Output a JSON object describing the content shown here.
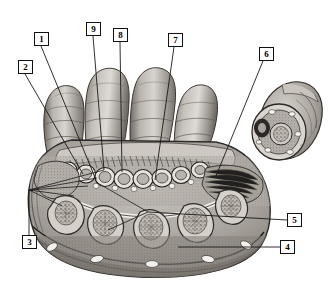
{
  "figure": {
    "kind": "anatomical-illustration",
    "style": "grayscale halftone engraving",
    "background_color": "#ffffff",
    "ink_color": "#111111",
    "leader_color": "#1a1a1a",
    "label_box": {
      "border_color": "#111111",
      "fill_color": "#ffffff",
      "text_color": "#000000",
      "width": 15,
      "height": 14
    },
    "palette": {
      "skin_light": "#d9d5d0",
      "skin_mid": "#b3aea8",
      "skin_dark": "#8a857f",
      "muscle_mid": "#9a948d",
      "muscle_dark": "#6f6a64",
      "bone_fill": "#cfcac4",
      "marrow": "#8e8881",
      "outline": "#2b2b2b",
      "fascia": "#efece8",
      "vessel": "#f5f3f0"
    }
  },
  "labels": [
    {
      "id": "1",
      "text": "1",
      "box": {
        "x": 34,
        "y": 32
      },
      "line": [
        [
          41,
          46
        ],
        [
          96,
          180
        ]
      ]
    },
    {
      "id": "2",
      "text": "2",
      "box": {
        "x": 18,
        "y": 60
      },
      "line": [
        [
          25,
          74
        ],
        [
          83,
          174
        ]
      ]
    },
    {
      "id": "3",
      "text": "3",
      "box": {
        "x": 22,
        "y": 235
      },
      "line": [
        [
          29,
          235
        ],
        [
          29,
          190
        ]
      ]
    },
    {
      "id": "4",
      "text": "4",
      "box": {
        "x": 280,
        "y": 240
      },
      "line": [
        [
          280,
          247
        ],
        [
          178,
          247
        ]
      ]
    },
    {
      "id": "5",
      "text": "5",
      "box": {
        "x": 287,
        "y": 213
      },
      "line": [
        [
          287,
          220
        ],
        [
          148,
          212
        ]
      ]
    },
    {
      "id": "6",
      "text": "6",
      "box": {
        "x": 259,
        "y": 47
      },
      "line": [
        [
          263,
          61
        ],
        [
          216,
          176
        ]
      ]
    },
    {
      "id": "7",
      "text": "7",
      "box": {
        "x": 168,
        "y": 33
      },
      "line": [
        [
          174,
          47
        ],
        [
          155,
          180
        ]
      ]
    },
    {
      "id": "8",
      "text": "8",
      "box": {
        "x": 113,
        "y": 28
      },
      "line": [
        [
          120,
          42
        ],
        [
          122,
          172
        ]
      ]
    },
    {
      "id": "9",
      "text": "9",
      "box": {
        "x": 86,
        "y": 22
      },
      "line": [
        [
          93,
          36
        ],
        [
          104,
          170
        ]
      ]
    }
  ],
  "fan_lines_from_label3": [
    [
      [
        29,
        190
      ],
      [
        104,
        170
      ]
    ],
    [
      [
        29,
        190
      ],
      [
        97,
        178
      ]
    ],
    [
      [
        29,
        190
      ],
      [
        88,
        186
      ]
    ],
    [
      [
        29,
        190
      ],
      [
        74,
        196
      ]
    ],
    [
      [
        29,
        190
      ],
      [
        62,
        206
      ]
    ]
  ],
  "fan_lines_from_label5": [
    [
      [
        148,
        212
      ],
      [
        96,
        182
      ]
    ],
    [
      [
        148,
        212
      ],
      [
        108,
        230
      ]
    ]
  ],
  "anatomy": {
    "fingers": [
      {
        "name": "index-finger",
        "cx": 62,
        "cy": 105
      },
      {
        "name": "middle-finger",
        "cx": 104,
        "cy": 92
      },
      {
        "name": "ring-finger",
        "cx": 148,
        "cy": 90
      },
      {
        "name": "little-finger",
        "cx": 190,
        "cy": 104
      }
    ],
    "inset": {
      "name": "thumb-cross-section",
      "cx": 288,
      "cy": 125
    },
    "palm_section": {
      "name": "palm-transverse-section",
      "cx": 140,
      "cy": 200
    },
    "tendon_sheaths": [
      {
        "cx": 86,
        "cy": 172
      },
      {
        "cx": 104,
        "cy": 177
      },
      {
        "cx": 122,
        "cy": 178
      },
      {
        "cx": 141,
        "cy": 178
      },
      {
        "cx": 160,
        "cy": 178
      },
      {
        "cx": 179,
        "cy": 175
      },
      {
        "cx": 200,
        "cy": 170
      },
      {
        "cx": 68,
        "cy": 170
      }
    ],
    "metacarpal_bones": [
      {
        "cx": 68,
        "cy": 213
      },
      {
        "cx": 106,
        "cy": 222
      },
      {
        "cx": 152,
        "cy": 226
      },
      {
        "cx": 196,
        "cy": 220
      },
      {
        "cx": 228,
        "cy": 206
      }
    ],
    "subcutaneous_vessels": [
      {
        "cx": 52,
        "cy": 247
      },
      {
        "cx": 97,
        "cy": 257
      },
      {
        "cx": 152,
        "cy": 262
      },
      {
        "cx": 208,
        "cy": 258
      },
      {
        "cx": 246,
        "cy": 244
      }
    ]
  }
}
